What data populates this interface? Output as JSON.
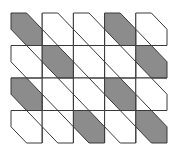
{
  "figure": {
    "grid": {
      "cols": 5,
      "rows": 4,
      "origin_x": 11,
      "origin_y": 13,
      "cell_w": 31.2,
      "cell_h": 32.5
    },
    "colors": {
      "background": "#ffffff",
      "line": "#3a3a3a",
      "shade": "#8c8c8c"
    },
    "shaded_cells": [
      [
        0,
        0
      ],
      [
        0,
        3
      ],
      [
        1,
        1
      ],
      [
        1,
        4
      ],
      [
        2,
        0
      ],
      [
        2,
        3
      ],
      [
        3,
        2
      ],
      [
        3,
        4
      ]
    ]
  }
}
